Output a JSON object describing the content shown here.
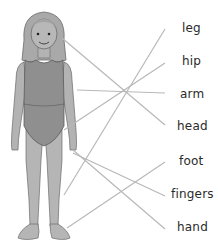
{
  "diagram": {
    "type": "matching-exercise",
    "line_color": "#b8b8b8",
    "figure_color": "#b0b0b0",
    "swimsuit_color": "#8e8e8e",
    "labels": [
      {
        "id": "leg",
        "text": "leg",
        "x": 182,
        "y": 21
      },
      {
        "id": "hip",
        "text": "hip",
        "x": 182,
        "y": 54
      },
      {
        "id": "arm",
        "text": "arm",
        "x": 180,
        "y": 87
      },
      {
        "id": "head",
        "text": "head",
        "x": 177,
        "y": 119
      },
      {
        "id": "foot",
        "text": "foot",
        "x": 179,
        "y": 154
      },
      {
        "id": "fingers",
        "text": "fingers",
        "x": 171,
        "y": 187
      },
      {
        "id": "hand",
        "text": "hand",
        "x": 177,
        "y": 220
      }
    ],
    "lines": [
      {
        "to": "head",
        "x1": 62,
        "y1": 38,
        "x2": 165,
        "y2": 125
      },
      {
        "to": "arm",
        "x1": 77,
        "y1": 90,
        "x2": 165,
        "y2": 93
      },
      {
        "to": "hip",
        "x1": 64,
        "y1": 130,
        "x2": 165,
        "y2": 63
      },
      {
        "to": "leg",
        "x1": 64,
        "y1": 195,
        "x2": 165,
        "y2": 29
      },
      {
        "to": "fingers",
        "x1": 73,
        "y1": 153,
        "x2": 165,
        "y2": 196
      },
      {
        "to": "hand",
        "x1": 73,
        "y1": 150,
        "x2": 165,
        "y2": 229
      },
      {
        "to": "foot",
        "x1": 67,
        "y1": 228,
        "x2": 165,
        "y2": 162
      }
    ]
  }
}
